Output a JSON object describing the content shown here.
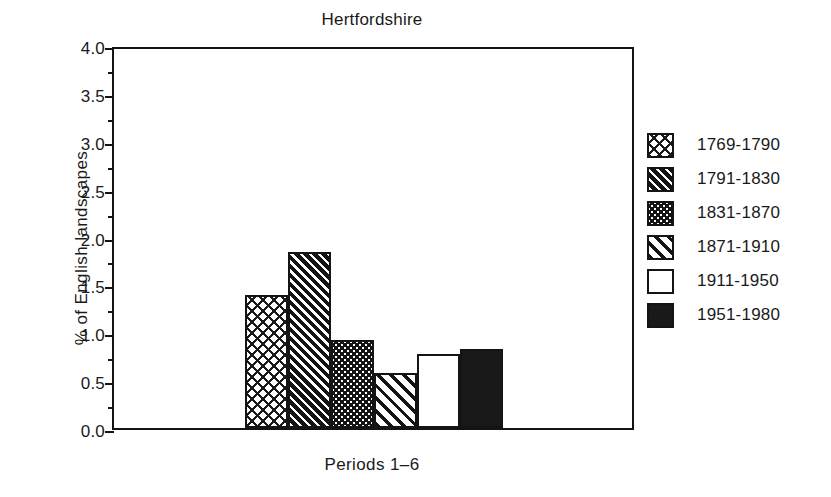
{
  "chart_data": {
    "type": "bar",
    "title": "Hertfordshire",
    "xlabel": "Periods 1–6",
    "ylabel": "% of English landscapes",
    "categories": [
      "1769-1790",
      "1791-1830",
      "1831-1870",
      "1871-1910",
      "1911-1950",
      "1951-1980"
    ],
    "values": [
      1.39,
      1.84,
      0.92,
      0.57,
      0.77,
      0.83
    ],
    "ylim": [
      0.0,
      4.0
    ],
    "ytick_labels": [
      "4.0",
      "3.5",
      "3.0",
      "2.5",
      "2.0",
      "1.5",
      "1.0",
      "0.5",
      "0.0"
    ],
    "ytick_values": [
      4.0,
      3.5,
      3.0,
      2.5,
      2.0,
      1.5,
      1.0,
      0.5,
      0.0
    ],
    "yminor_values": [
      3.75,
      3.25,
      2.75,
      2.25,
      1.75,
      1.25,
      0.75,
      0.25
    ],
    "grid": false,
    "legend_position": "right",
    "series_patterns": [
      "dash-scatter",
      "dark-diagonal-dash",
      "dark-dots",
      "light-diagonal-stripe",
      "solid-white",
      "solid-black"
    ],
    "colors": {
      "axis": "#141414",
      "text": "#1a1a1a",
      "background": "#ffffff",
      "fill_dark": "#141414",
      "fill_light": "#ffffff"
    }
  },
  "legend": {
    "items": [
      {
        "label": "1769-1790",
        "pattern": "dash-scatter"
      },
      {
        "label": "1791-1830",
        "pattern": "dark-diagonal-dash"
      },
      {
        "label": "1831-1870",
        "pattern": "dark-dots"
      },
      {
        "label": "1871-1910",
        "pattern": "light-diagonal-stripe"
      },
      {
        "label": "1911-1950",
        "pattern": "solid-white"
      },
      {
        "label": "1951-1980",
        "pattern": "solid-black"
      }
    ]
  }
}
